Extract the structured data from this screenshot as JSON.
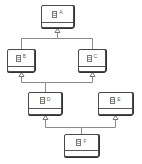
{
  "diagram": {
    "type": "uml-class-inheritance",
    "colors": {
      "border": "#4a4a4a",
      "edge": "#888888",
      "label": "#666666",
      "background": "#ffffff"
    },
    "nodes": [
      {
        "id": "A",
        "label": "A",
        "icon": "class-icon",
        "x": 41,
        "y": 5,
        "w": 33,
        "h": 23,
        "divider": 17
      },
      {
        "id": "B",
        "label": "B",
        "icon": "class-icon",
        "x": 7,
        "y": 49,
        "w": 28,
        "h": 23,
        "divider": 17
      },
      {
        "id": "C",
        "label": "C",
        "icon": "class-icon",
        "x": 78,
        "y": 49,
        "w": 28,
        "h": 23,
        "divider": 17
      },
      {
        "id": "D",
        "label": "D",
        "icon": "class-icon",
        "x": 28,
        "y": 92,
        "w": 34,
        "h": 23,
        "divider": 16
      },
      {
        "id": "E",
        "label": "E",
        "icon": "class-icon",
        "x": 98,
        "y": 92,
        "w": 35,
        "h": 23,
        "divider": 16
      },
      {
        "id": "F",
        "label": "F",
        "icon": "class-icon",
        "x": 64,
        "y": 134,
        "w": 35,
        "h": 23,
        "divider": 16
      }
    ],
    "edges": [
      {
        "from": "B",
        "to": "A",
        "kind": "generalization"
      },
      {
        "from": "C",
        "to": "A",
        "kind": "generalization"
      },
      {
        "from": "D",
        "to": "B",
        "kind": "generalization"
      },
      {
        "from": "D",
        "to": "C",
        "kind": "generalization"
      },
      {
        "from": "F",
        "to": "D",
        "kind": "generalization"
      },
      {
        "from": "F",
        "to": "E",
        "kind": "generalization"
      }
    ]
  }
}
